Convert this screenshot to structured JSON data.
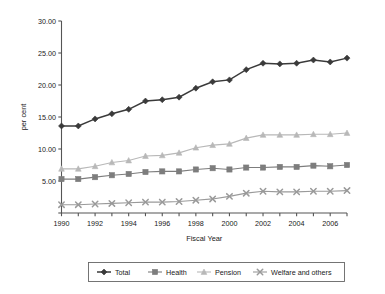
{
  "chart_data": {
    "type": "line",
    "title": "",
    "xlabel": "Fiscal Year",
    "ylabel": "per cent",
    "x": [
      1990,
      1991,
      1992,
      1993,
      1994,
      1995,
      1996,
      1997,
      1998,
      1999,
      2000,
      2001,
      2002,
      2003,
      2004,
      2005,
      2006,
      2007
    ],
    "xtick_labels": [
      "1990",
      "1992",
      "1994",
      "1996",
      "1998",
      "2000",
      "2002",
      "2004",
      "2006"
    ],
    "xtick_values": [
      1990,
      1992,
      1994,
      1996,
      1998,
      2000,
      2002,
      2004,
      2006
    ],
    "xlim": [
      1990,
      2007
    ],
    "ytick_labels": [
      "5.00",
      "10.00",
      "15.00",
      "20.00",
      "25.00",
      "30.00"
    ],
    "ytick_values": [
      5,
      10,
      15,
      20,
      25,
      30
    ],
    "ylim": [
      0,
      30
    ],
    "grid": false,
    "legend_position": "bottom",
    "series": [
      {
        "name": "Total",
        "color": "#3a3a3a",
        "marker": "diamond",
        "values": [
          13.6,
          13.6,
          14.7,
          15.5,
          16.2,
          17.5,
          17.7,
          18.1,
          19.5,
          20.5,
          20.8,
          22.4,
          23.4,
          23.3,
          23.4,
          23.9,
          23.6,
          24.2
        ]
      },
      {
        "name": "Health",
        "color": "#7d7d7d",
        "marker": "square",
        "values": [
          5.3,
          5.3,
          5.6,
          5.9,
          6.1,
          6.4,
          6.5,
          6.5,
          6.8,
          7.0,
          6.8,
          7.1,
          7.1,
          7.2,
          7.2,
          7.4,
          7.3,
          7.5
        ]
      },
      {
        "name": "Pension",
        "color": "#b8b8b8",
        "marker": "triangle",
        "values": [
          6.9,
          6.9,
          7.3,
          7.9,
          8.2,
          8.9,
          9.0,
          9.4,
          10.2,
          10.6,
          10.8,
          11.7,
          12.2,
          12.2,
          12.2,
          12.3,
          12.3,
          12.5
        ]
      },
      {
        "name": "Welfare and others",
        "color": "#9a9a9a",
        "marker": "cross",
        "values": [
          1.3,
          1.3,
          1.4,
          1.5,
          1.6,
          1.7,
          1.7,
          1.8,
          2.0,
          2.2,
          2.6,
          3.1,
          3.4,
          3.3,
          3.3,
          3.4,
          3.4,
          3.5
        ]
      }
    ]
  },
  "legend": {
    "items": [
      "Total",
      "Health",
      "Pension",
      "Welfare and others"
    ]
  },
  "axes": {
    "x_title": "Fiscal Year",
    "y_title": "per cent"
  }
}
